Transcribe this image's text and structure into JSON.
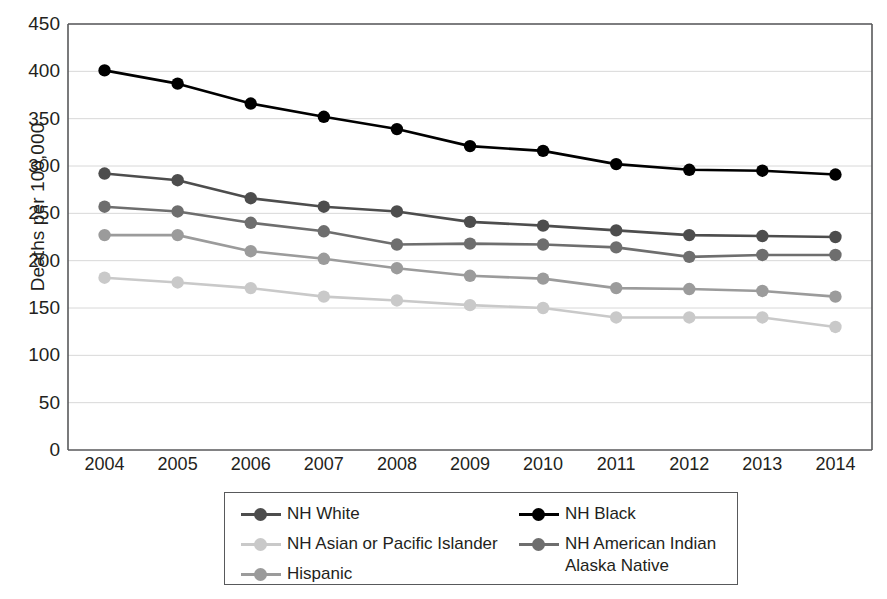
{
  "chart_data": {
    "type": "line",
    "title": "",
    "xlabel": "",
    "ylabel": "Deaths per 100,000",
    "x": [
      2004,
      2005,
      2006,
      2007,
      2008,
      2009,
      2010,
      2011,
      2012,
      2013,
      2014
    ],
    "categories": [
      "2004",
      "2005",
      "2006",
      "2007",
      "2008",
      "2009",
      "2010",
      "2011",
      "2012",
      "2013",
      "2014"
    ],
    "ylim": [
      0,
      450
    ],
    "yticks": [
      0,
      50,
      100,
      150,
      200,
      250,
      300,
      350,
      400,
      450
    ],
    "ytick_labels": [
      "0",
      "50",
      "100",
      "150",
      "200",
      "250",
      "300",
      "350",
      "400",
      "450"
    ],
    "grid": true,
    "legend_position": "bottom",
    "series": [
      {
        "name": "NH White",
        "color": "#4d4d4d",
        "values": [
          292,
          285,
          266,
          257,
          252,
          241,
          237,
          232,
          227,
          226,
          225
        ]
      },
      {
        "name": "NH Black",
        "color": "#000000",
        "values": [
          401,
          387,
          366,
          352,
          339,
          321,
          316,
          302,
          296,
          295,
          291
        ]
      },
      {
        "name": "NH Asian or Pacific Islander",
        "color": "#c9c9c9",
        "values": [
          182,
          177,
          171,
          162,
          158,
          153,
          150,
          140,
          140,
          140,
          130
        ]
      },
      {
        "name": "NH American Indian\nAlaska Native",
        "color": "#6e6e6e",
        "values": [
          257,
          252,
          240,
          231,
          217,
          218,
          217,
          214,
          204,
          206,
          206
        ]
      },
      {
        "name": "Hispanic",
        "color": "#9b9b9b",
        "values": [
          227,
          227,
          210,
          202,
          192,
          184,
          181,
          171,
          170,
          168,
          162
        ]
      }
    ]
  },
  "legend": {
    "entries": [
      {
        "label": "NH White",
        "color": "#4d4d4d",
        "column": 0,
        "row": 0
      },
      {
        "label": "NH Black",
        "color": "#000000",
        "column": 1,
        "row": 0
      },
      {
        "label": "NH Asian or Pacific Islander",
        "color": "#c9c9c9",
        "column": 0,
        "row": 1
      },
      {
        "label": "NH American Indian\nAlaska Native",
        "color": "#6e6e6e",
        "column": 1,
        "row": 1
      },
      {
        "label": "Hispanic",
        "color": "#9b9b9b",
        "column": 0,
        "row": 2
      }
    ]
  },
  "axes": {
    "frame_color": "#58595b",
    "grid_color": "#d8d8d8"
  }
}
